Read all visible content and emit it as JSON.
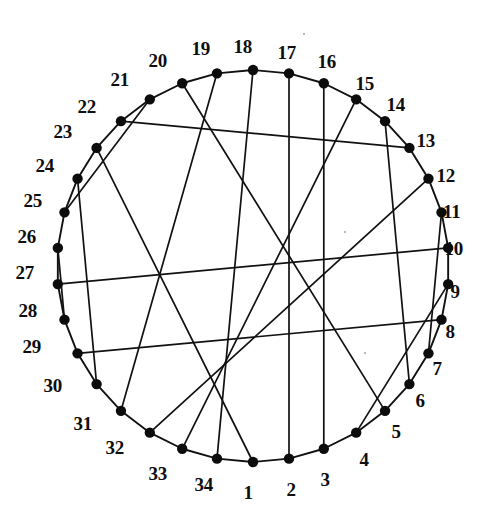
{
  "figure": {
    "title": "",
    "type": "circulant-graph-diagram",
    "geometry": {
      "center_x": 253,
      "center_y": 266,
      "radius": 196,
      "vertex_count": 34,
      "vertex_radius_px": 5.2,
      "start_angle_deg": 90,
      "direction": "counterclockwise",
      "label_offset_px": 22
    },
    "style": {
      "background": "#ffffff",
      "line_color": "#111111",
      "vertex_color": "#0c0c0c",
      "label_color": "#0e0e0e"
    },
    "vertex_labels": [
      "1",
      "2",
      "3",
      "4",
      "5",
      "6",
      "7",
      "8",
      "9",
      "10",
      "11",
      "12",
      "13",
      "14",
      "15",
      "16",
      "17",
      "18",
      "19",
      "20",
      "21",
      "22",
      "23",
      "24",
      "25",
      "26",
      "27",
      "28",
      "29",
      "30",
      "31",
      "32",
      "33",
      "34"
    ],
    "cycle_edges": [
      [
        1,
        2
      ],
      [
        2,
        3
      ],
      [
        3,
        4
      ],
      [
        4,
        5
      ],
      [
        5,
        6
      ],
      [
        6,
        7
      ],
      [
        7,
        8
      ],
      [
        8,
        9
      ],
      [
        9,
        10
      ],
      [
        10,
        11
      ],
      [
        11,
        12
      ],
      [
        12,
        13
      ],
      [
        13,
        14
      ],
      [
        14,
        15
      ],
      [
        15,
        16
      ],
      [
        16,
        17
      ],
      [
        17,
        18
      ],
      [
        18,
        19
      ],
      [
        19,
        20
      ],
      [
        20,
        21
      ],
      [
        21,
        22
      ],
      [
        22,
        23
      ],
      [
        23,
        24
      ],
      [
        24,
        25
      ],
      [
        25,
        26
      ],
      [
        26,
        27
      ],
      [
        27,
        28
      ],
      [
        28,
        29
      ],
      [
        29,
        30
      ],
      [
        30,
        31
      ],
      [
        31,
        32
      ],
      [
        32,
        33
      ],
      [
        33,
        34
      ],
      [
        34,
        1
      ]
    ],
    "chord_edges": [
      [
        1,
        23
      ],
      [
        2,
        17
      ],
      [
        3,
        16
      ],
      [
        4,
        9
      ],
      [
        5,
        20
      ],
      [
        6,
        14
      ],
      [
        7,
        11
      ],
      [
        8,
        29
      ],
      [
        10,
        27
      ],
      [
        12,
        32
      ],
      [
        13,
        22
      ],
      [
        15,
        33
      ],
      [
        18,
        34
      ],
      [
        19,
        31
      ],
      [
        21,
        25
      ],
      [
        24,
        30
      ],
      [
        26,
        28
      ]
    ],
    "chord_count": 17,
    "vertex_label_positions": [
      {
        "label": "1",
        "x": 248,
        "y": 492
      },
      {
        "label": "2",
        "x": 291,
        "y": 489
      },
      {
        "label": "3",
        "x": 325,
        "y": 479
      },
      {
        "label": "4",
        "x": 364,
        "y": 459
      },
      {
        "label": "5",
        "x": 396,
        "y": 431
      },
      {
        "label": "6",
        "x": 420,
        "y": 400
      },
      {
        "label": "7",
        "x": 437,
        "y": 368
      },
      {
        "label": "8",
        "x": 450,
        "y": 331
      },
      {
        "label": "9",
        "x": 455,
        "y": 291
      },
      {
        "label": "10",
        "x": 454,
        "y": 248
      },
      {
        "label": "11",
        "x": 452,
        "y": 211
      },
      {
        "label": "12",
        "x": 446,
        "y": 175
      },
      {
        "label": "13",
        "x": 426,
        "y": 140
      },
      {
        "label": "14",
        "x": 396,
        "y": 104
      },
      {
        "label": "15",
        "x": 365,
        "y": 83
      },
      {
        "label": "16",
        "x": 327,
        "y": 61
      },
      {
        "label": "17",
        "x": 287,
        "y": 52
      },
      {
        "label": "18",
        "x": 243,
        "y": 46
      },
      {
        "label": "19",
        "x": 201,
        "y": 48
      },
      {
        "label": "20",
        "x": 158,
        "y": 60
      },
      {
        "label": "21",
        "x": 120,
        "y": 79
      },
      {
        "label": "22",
        "x": 87,
        "y": 106
      },
      {
        "label": "23",
        "x": 63,
        "y": 131
      },
      {
        "label": "24",
        "x": 45,
        "y": 165
      },
      {
        "label": "25",
        "x": 33,
        "y": 200
      },
      {
        "label": "26",
        "x": 27,
        "y": 236
      },
      {
        "label": "27",
        "x": 25,
        "y": 272
      },
      {
        "label": "28",
        "x": 28,
        "y": 310
      },
      {
        "label": "29",
        "x": 32,
        "y": 346
      },
      {
        "label": "30",
        "x": 53,
        "y": 385
      },
      {
        "label": "31",
        "x": 83,
        "y": 423
      },
      {
        "label": "32",
        "x": 115,
        "y": 447
      },
      {
        "label": "33",
        "x": 158,
        "y": 473
      },
      {
        "label": "34",
        "x": 204,
        "y": 484
      }
    ]
  }
}
